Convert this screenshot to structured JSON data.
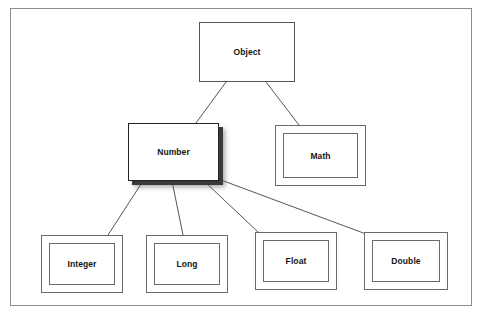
{
  "diagram": {
    "background_color": "#ffffff",
    "frame_color": "#8d8d8d",
    "line_color": "#555555",
    "shadow_color": "#3a3a3a",
    "nodes": [
      {
        "id": "object",
        "label": "Object",
        "style": "plain",
        "x": 199,
        "y": 22,
        "width": 96,
        "height": 60
      },
      {
        "id": "number",
        "label": "Number",
        "style": "shadow",
        "x": 128,
        "y": 123,
        "width": 91,
        "height": 58
      },
      {
        "id": "math",
        "label": "Math",
        "style": "double",
        "x": 275,
        "y": 125,
        "width": 91,
        "height": 61
      },
      {
        "id": "integer",
        "label": "Integer",
        "style": "double",
        "x": 41,
        "y": 235,
        "width": 82,
        "height": 58
      },
      {
        "id": "long",
        "label": "Long",
        "style": "double",
        "x": 146,
        "y": 235,
        "width": 82,
        "height": 58
      },
      {
        "id": "float",
        "label": "Float",
        "style": "double",
        "x": 255,
        "y": 232,
        "width": 82,
        "height": 58
      },
      {
        "id": "double",
        "label": "Double",
        "style": "double",
        "x": 364,
        "y": 232,
        "width": 84,
        "height": 58
      }
    ],
    "edges": [
      {
        "id": "object-number",
        "from": "object",
        "to": "number",
        "x1": 226,
        "y1": 82,
        "x2": 196,
        "y2": 123
      },
      {
        "id": "object-math",
        "from": "object",
        "to": "math",
        "x1": 266,
        "y1": 82,
        "x2": 299,
        "y2": 125
      },
      {
        "id": "number-integer",
        "from": "number",
        "to": "integer",
        "x1": 143,
        "y1": 181,
        "x2": 108,
        "y2": 235
      },
      {
        "id": "number-long",
        "from": "number",
        "to": "long",
        "x1": 172,
        "y1": 181,
        "x2": 183,
        "y2": 235
      },
      {
        "id": "number-float",
        "from": "number",
        "to": "float",
        "x1": 204,
        "y1": 181,
        "x2": 258,
        "y2": 232
      },
      {
        "id": "number-double",
        "from": "number",
        "to": "double",
        "x1": 221,
        "y1": 180,
        "x2": 366,
        "y2": 234
      }
    ]
  }
}
